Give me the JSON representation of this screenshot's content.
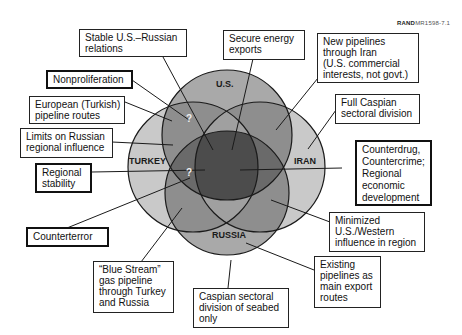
{
  "figure_tag": {
    "prefix": "RAND",
    "id": "MR1598-7.1"
  },
  "circles": [
    {
      "name": "U.S.",
      "fill": "#a8a8a8"
    },
    {
      "name": "TURKEY",
      "fill": "#c8c8c8"
    },
    {
      "name": "IRAN",
      "fill": "#c8c8c8"
    },
    {
      "name": "RUSSIA",
      "fill": "#a8a8a8"
    }
  ],
  "center_fill": "#4a4a4a",
  "question_marks": [
    "?",
    "?"
  ],
  "callouts": [
    {
      "text": "Stable U.S.–Russian relations",
      "lines": [
        "Stable U.S.–Russian",
        "relations"
      ]
    },
    {
      "text": "Secure energy exports",
      "lines": [
        "Secure energy",
        "exports"
      ]
    },
    {
      "text": "New pipelines through Iran (U.S. commercial interests, not govt.)",
      "lines": [
        "New pipelines",
        "through Iran",
        "(U.S. commercial",
        "interests, not govt.)"
      ]
    },
    {
      "text": "Nonproliferation",
      "lines": [
        "Nonproliferation"
      ]
    },
    {
      "text": "European (Turkish) pipeline routes",
      "lines": [
        "European (Turkish)",
        "pipeline routes"
      ]
    },
    {
      "text": "Full Caspian sectoral division",
      "lines": [
        "Full Caspian",
        "sectoral division"
      ]
    },
    {
      "text": "Limits on Russian regional influence",
      "lines": [
        "Limits on Russian",
        "regional influence"
      ]
    },
    {
      "text": "Counterdrug, Countercrime; Regional economic development",
      "lines": [
        "Counterdrug,",
        "Countercrime;",
        "Regional",
        "economic",
        "development"
      ]
    },
    {
      "text": "Regional stability",
      "lines": [
        "Regional",
        "stability"
      ]
    },
    {
      "text": "Minimized U.S./Western influence in region",
      "lines": [
        "Minimized",
        "U.S./Western",
        "influence in region"
      ]
    },
    {
      "text": "Counterterror",
      "lines": [
        "Counterterror"
      ]
    },
    {
      "text": "Existing pipelines as main export routes",
      "lines": [
        "Existing",
        "pipelines as",
        "main export",
        "routes"
      ]
    },
    {
      "text": "“Blue Stream” gas pipeline through Turkey and Russia",
      "lines": [
        "“Blue Stream”",
        "gas pipeline",
        "through Turkey",
        "and Russia"
      ]
    },
    {
      "text": "Caspian sectoral division of seabed only",
      "lines": [
        "Caspian sectoral",
        "division of seabed",
        "only"
      ]
    }
  ]
}
